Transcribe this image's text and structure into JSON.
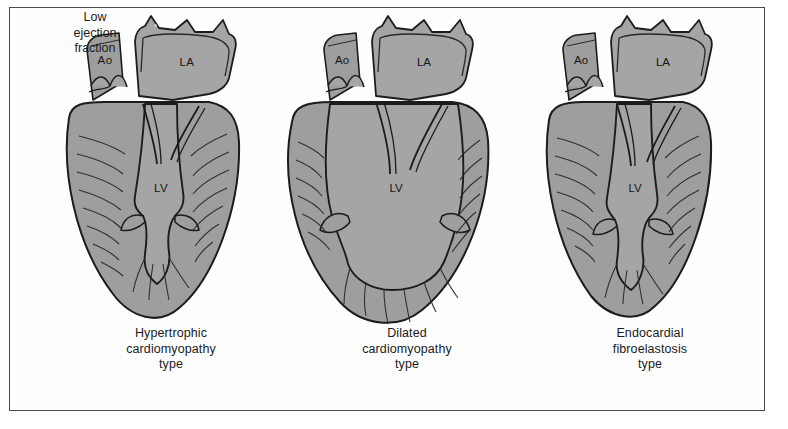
{
  "figure": {
    "annotation": "Low\nejection\nfraction",
    "annotation_lines": [
      "Low",
      "ejection",
      "fraction"
    ],
    "border_color": "#4a4a4a",
    "background": "#ffffff"
  },
  "palette": {
    "myocardium_fill": "#9e9e9e",
    "chamber_fill": "#a5a5a5",
    "vessel_fill": "#9a9a9a",
    "outline": "#1c1c1c",
    "trabeculae": "#2a2a2a",
    "text": "#1a1a1a"
  },
  "panels": [
    {
      "id": "hypertrophic",
      "caption_lines": [
        "Hypertrophic",
        "cardiomyopathy",
        "type"
      ],
      "labels": {
        "aorta": "Ao",
        "left_atrium": "LA",
        "left_ventricle": "LV"
      }
    },
    {
      "id": "dilated",
      "caption_lines": [
        "Dilated",
        "cardiomyopathy",
        "type"
      ],
      "labels": {
        "aorta": "Ao",
        "left_atrium": "LA",
        "left_ventricle": "LV"
      }
    },
    {
      "id": "endocardial-fibroelastosis",
      "caption_lines": [
        "Endocardial",
        "fibroelastosis",
        "type"
      ],
      "labels": {
        "aorta": "Ao",
        "left_atrium": "LA",
        "left_ventricle": "LV"
      }
    }
  ]
}
